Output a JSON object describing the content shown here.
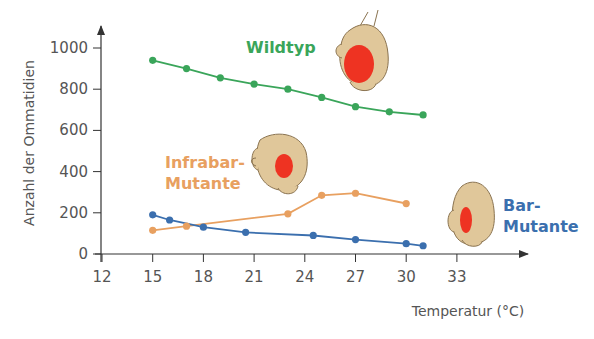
{
  "chart_data": {
    "type": "line",
    "title": "",
    "xlabel": "Temperatur (°C)",
    "ylabel": "Anzahl der Ommatidien",
    "xlim": [
      12,
      35
    ],
    "ylim": [
      0,
      1100
    ],
    "xticks": [
      12,
      15,
      18,
      21,
      24,
      27,
      30,
      33
    ],
    "yticks": [
      0,
      200,
      400,
      600,
      800,
      1000
    ],
    "grid": false,
    "legend": "inline labels next to each series",
    "series": [
      {
        "name": "Wildtyp",
        "label_lines": [
          "Wildtyp"
        ],
        "color": "#3aa55a",
        "x": [
          15,
          17,
          19,
          21,
          23,
          25,
          27,
          29,
          31
        ],
        "y": [
          940,
          900,
          855,
          825,
          800,
          760,
          715,
          690,
          675
        ]
      },
      {
        "name": "Infrabar-Mutante",
        "label_lines": [
          "Infrabar-",
          "Mutante"
        ],
        "color": "#e8a060",
        "x": [
          15,
          17,
          23,
          25,
          27,
          30
        ],
        "y": [
          115,
          135,
          195,
          285,
          295,
          245
        ]
      },
      {
        "name": "Bar-Mutante",
        "label_lines": [
          "Bar-",
          "Mutante"
        ],
        "color": "#3b6fae",
        "x": [
          15,
          16,
          18,
          20.5,
          24.5,
          27,
          30,
          31
        ],
        "y": [
          190,
          165,
          130,
          105,
          90,
          70,
          50,
          40
        ]
      }
    ],
    "illustrations": [
      {
        "name": "wildtyp-fly-head",
        "eye": "large round red eye"
      },
      {
        "name": "infrabar-fly-head",
        "eye": "medium round red eye"
      },
      {
        "name": "bar-fly-head",
        "eye": "narrow bar-shaped red eye"
      }
    ]
  },
  "colors": {
    "axis": "#333333",
    "head_fill": "#e0c79a",
    "head_stroke": "#8a7350",
    "eye": "#ee3322"
  }
}
